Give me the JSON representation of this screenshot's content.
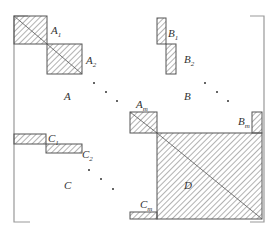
{
  "diagram": {
    "colors": {
      "stroke": "#555555",
      "hatch": "#555555",
      "bracket": "#999999",
      "background": "#ffffff"
    },
    "labels": {
      "A": "A",
      "B": "B",
      "C": "C",
      "D": "D",
      "A1": {
        "base": "A",
        "sub": "1"
      },
      "A2": {
        "base": "A",
        "sub": "2"
      },
      "Am": {
        "base": "A",
        "sub": "m"
      },
      "B1": {
        "base": "B",
        "sub": "1"
      },
      "B2": {
        "base": "B",
        "sub": "2"
      },
      "Bm": {
        "base": "B",
        "sub": "m"
      },
      "C1": {
        "base": "C",
        "sub": "1"
      },
      "C2": {
        "base": "C",
        "sub": "2"
      },
      "Cm": {
        "base": "C",
        "sub": "m"
      }
    },
    "ellipsis": "· · ·"
  }
}
